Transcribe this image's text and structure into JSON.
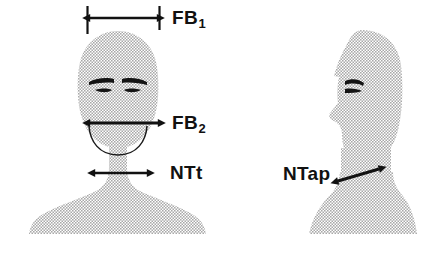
{
  "figure": {
    "type": "anthropometric-measurement-diagram",
    "background_color": "#ffffff",
    "silhouette_fill": "#c9c9c9",
    "silhouette_pattern": "halftone-dither-dots",
    "annotation_color": "#111111",
    "width": 441,
    "height": 258
  },
  "views": {
    "frontal": {
      "name": "frontal-head-and-shoulders",
      "features": [
        "head",
        "left-eyebrow",
        "right-eyebrow",
        "left-eye",
        "right-eye",
        "jaw-outline",
        "neck",
        "shoulders"
      ]
    },
    "profile": {
      "name": "profile-head-and-shoulders",
      "facing": "left",
      "features": [
        "head",
        "nose",
        "eyebrow",
        "eye",
        "neck",
        "shoulders"
      ]
    }
  },
  "measurements": [
    {
      "id": "fb1",
      "label": "FB",
      "subscript": "1",
      "full_label": "FB1",
      "view": "frontal",
      "description": "head breadth across widest part of skull, above head",
      "arrow": "double-headed-horizontal",
      "has_extension_ticks": true,
      "x_start": 88,
      "x_end": 159,
      "y": 18
    },
    {
      "id": "fb2",
      "label": "FB",
      "subscript": "2",
      "full_label": "FB2",
      "view": "frontal",
      "description": "face breadth at bizygomatic level",
      "arrow": "double-headed-horizontal",
      "has_extension_ticks": false,
      "x_start": 88,
      "x_end": 160,
      "y": 123
    },
    {
      "id": "ntt",
      "label": "NTt",
      "subscript": "",
      "full_label": "NTt",
      "view": "frontal",
      "description": "neck thickness transverse",
      "arrow": "double-headed-horizontal",
      "has_extension_ticks": false,
      "x_start": 93,
      "x_end": 149,
      "y": 173
    },
    {
      "id": "ntap",
      "label": "NTap",
      "subscript": "",
      "full_label": "NTap",
      "view": "profile",
      "description": "neck thickness anteroposterior",
      "arrow": "double-headed-diagonal",
      "has_extension_ticks": false,
      "x_start": 336,
      "y_start": 182,
      "x_end": 381,
      "y_end": 168
    }
  ]
}
